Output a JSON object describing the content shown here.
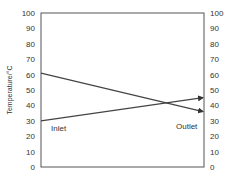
{
  "chart_data": {
    "type": "line",
    "title": "",
    "xlabel": "",
    "ylabel": "Temperature/°C",
    "ylim": [
      0,
      100
    ],
    "yticks": [
      0,
      10,
      20,
      30,
      40,
      50,
      60,
      70,
      80,
      90,
      100
    ],
    "secondary_yticks": [
      0,
      10,
      20,
      30,
      40,
      50,
      60,
      70,
      80,
      90,
      100
    ],
    "grid": false,
    "x": [
      "left",
      "right"
    ],
    "series": [
      {
        "name": "Hot stream",
        "values": [
          61,
          36
        ],
        "arrow_end": true
      },
      {
        "name": "Cold stream",
        "values": [
          30,
          45
        ],
        "arrow_end": true
      }
    ],
    "annotations": [
      {
        "text": "Inlet",
        "position": "lower-left"
      },
      {
        "text": "Outlet",
        "position": "lower-right"
      }
    ]
  },
  "labels": {
    "ylabel": "Temperature/°C",
    "inlet": "Inlet",
    "outlet": "Outlet"
  },
  "colors": {
    "axis": "#555555",
    "line": "#444444",
    "text": "#333333"
  }
}
